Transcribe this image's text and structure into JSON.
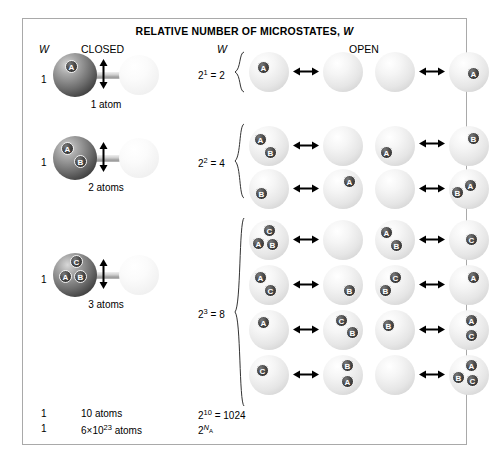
{
  "figure": {
    "title": "RELATIVE NUMBER OF MICROSTATES, W",
    "title_symbol": "W",
    "title_prefix": "RELATIVE NUMBER OF MICROSTATES, ",
    "columns": {
      "closed_w": "W",
      "closed_heading": "CLOSED",
      "open_w": "W",
      "open_heading": "OPEN"
    },
    "closed_rows": [
      {
        "w": "1",
        "caption": "1 atom",
        "atoms": [
          "A"
        ]
      },
      {
        "w": "1",
        "caption": "2 atoms",
        "atoms": [
          "A",
          "B"
        ]
      },
      {
        "w": "1",
        "caption": "3 atoms",
        "atoms": [
          "C",
          "A",
          "B"
        ]
      }
    ],
    "open_groups": [
      {
        "power_base": "2",
        "power_exp": "1",
        "equals": " = 2",
        "label": "2^1 = 2",
        "microstates": [
          {
            "left": [
              "A"
            ],
            "right": []
          },
          {
            "left": [],
            "right": [
              "A"
            ]
          }
        ]
      },
      {
        "power_base": "2",
        "power_exp": "2",
        "equals": " = 4",
        "label": "2^2 = 4",
        "microstates": [
          {
            "left": [
              "A",
              "B"
            ],
            "right": []
          },
          {
            "left": [
              "A"
            ],
            "right": [
              "B"
            ]
          },
          {
            "left": [
              "B"
            ],
            "right": [
              "A"
            ]
          },
          {
            "left": [],
            "right": [
              "B",
              "A"
            ]
          }
        ]
      },
      {
        "power_base": "2",
        "power_exp": "3",
        "equals": " = 8",
        "label": "2^3 = 8",
        "microstates": [
          {
            "left": [
              "C",
              "A",
              "B"
            ],
            "right": []
          },
          {
            "left": [
              "A",
              "B"
            ],
            "right": [
              "C"
            ]
          },
          {
            "left": [
              "A",
              "C"
            ],
            "right": [
              "B"
            ]
          },
          {
            "left": [
              "C",
              "B"
            ],
            "right": [
              "A"
            ]
          },
          {
            "left": [
              "A"
            ],
            "right": [
              "C",
              "B"
            ]
          },
          {
            "left": [
              "B"
            ],
            "right": [
              "A",
              "C"
            ]
          },
          {
            "left": [
              "C"
            ],
            "right": [
              "B",
              "A"
            ]
          },
          {
            "left": [],
            "right": [
              "A",
              "B",
              "C"
            ]
          }
        ]
      }
    ],
    "summary_rows": [
      {
        "closed_w": "1",
        "caption": "10 atoms",
        "open_base": "2",
        "open_exp": "10",
        "open_rest": " = 1024"
      },
      {
        "closed_w": "1",
        "caption_pre": "6×10",
        "caption_exp": "23",
        "caption_post": " atoms",
        "open_base": "2",
        "open_exp": "NA",
        "open_rest": ""
      }
    ],
    "colors": {
      "border": "#a9a9a9",
      "background": "#ffffff",
      "closed_sphere": "#5a5a5a",
      "open_sphere": "#e9e9e9",
      "atom_badge": "#333333",
      "text": "#000000"
    }
  }
}
